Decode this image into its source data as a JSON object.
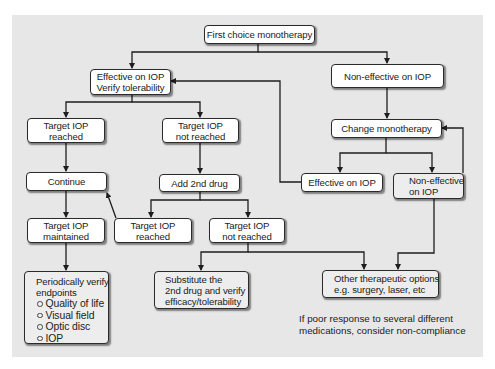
{
  "diagram": {
    "type": "flowchart",
    "colors": {
      "panel_background": "#e7e7e7",
      "box_fill": "#ffffff",
      "leaf_box_fill": "#ededed",
      "line": "#1e1e1e"
    },
    "nodes": {
      "first_choice": {
        "lines": [
          "First choice monotherapy"
        ]
      },
      "effective_verify": {
        "lines": [
          "Effective on IOP",
          "Verify tolerability"
        ]
      },
      "non_effective_top": {
        "lines": [
          "Non-effective on IOP"
        ]
      },
      "target_reached_left": {
        "lines": [
          "Target IOP",
          "reached"
        ]
      },
      "target_not_reached_top": {
        "lines": [
          "Target IOP",
          "not reached"
        ]
      },
      "change_monotherapy": {
        "lines": [
          "Change monotherapy"
        ]
      },
      "continue": {
        "lines": [
          "Continue"
        ]
      },
      "add_2nd_drug": {
        "lines": [
          "Add 2nd drug"
        ]
      },
      "effective_right": {
        "lines": [
          "Effective on IOP"
        ]
      },
      "non_effective_right": {
        "lines": [
          "Non-effective",
          "on IOP"
        ]
      },
      "target_maintained": {
        "lines": [
          "Target IOP",
          "maintained"
        ]
      },
      "target_reached_mid": {
        "lines": [
          "Target IOP",
          "reached"
        ]
      },
      "target_not_reached_mid": {
        "lines": [
          "Target IOP",
          "not reached"
        ]
      },
      "periodically_verify": {
        "lines": [
          "Periodically verify",
          "endpoints"
        ],
        "bullets": [
          "Quality of life",
          "Visual field",
          "Optic disc",
          "IOP"
        ]
      },
      "substitute": {
        "lines": [
          "Substitute the",
          "2nd drug and verify",
          "efficacy/tolerability"
        ]
      },
      "other_options": {
        "lines": [
          "Other therapeutic options",
          "e.g. surgery, laser, etc"
        ]
      }
    },
    "note": {
      "lines": [
        "If poor response to several different",
        "medications, consider non-compliance"
      ]
    },
    "edges": [
      [
        "first_choice",
        "effective_verify"
      ],
      [
        "first_choice",
        "non_effective_top"
      ],
      [
        "effective_verify",
        "target_reached_left"
      ],
      [
        "effective_verify",
        "target_not_reached_top"
      ],
      [
        "non_effective_top",
        "change_monotherapy"
      ],
      [
        "target_reached_left",
        "continue"
      ],
      [
        "target_not_reached_top",
        "add_2nd_drug"
      ],
      [
        "change_monotherapy",
        "effective_right"
      ],
      [
        "change_monotherapy",
        "non_effective_right"
      ],
      [
        "effective_right",
        "effective_verify"
      ],
      [
        "non_effective_right",
        "change_monotherapy"
      ],
      [
        "continue",
        "target_maintained"
      ],
      [
        "add_2nd_drug",
        "target_reached_mid"
      ],
      [
        "add_2nd_drug",
        "target_not_reached_mid"
      ],
      [
        "target_reached_mid",
        "continue"
      ],
      [
        "target_maintained",
        "periodically_verify"
      ],
      [
        "target_not_reached_mid",
        "substitute"
      ],
      [
        "target_not_reached_mid",
        "other_options"
      ],
      [
        "non_effective_right",
        "other_options"
      ]
    ]
  }
}
